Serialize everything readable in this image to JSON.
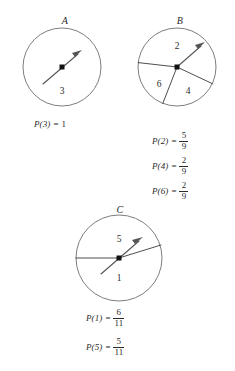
{
  "figure": {
    "type": "probability-spinners",
    "background": "#ffffff",
    "stroke_color": "#6e6e6e",
    "text_color": "#2b2b2b"
  },
  "spinners": [
    {
      "id": "A",
      "label": "A",
      "sectors": [
        {
          "value": "3",
          "label": "3"
        }
      ],
      "captions": [
        {
          "lhs": "P(3)",
          "eq": "=",
          "whole": "1"
        }
      ]
    },
    {
      "id": "B",
      "label": "B",
      "sectors": [
        {
          "value": "2",
          "label": "2"
        },
        {
          "value": "6",
          "label": "6"
        },
        {
          "value": "4",
          "label": "4"
        }
      ],
      "captions": [
        {
          "lhs": "P(2)",
          "eq": "=",
          "num": "5",
          "den": "9"
        },
        {
          "lhs": "P(4)",
          "eq": "=",
          "num": "2",
          "den": "9"
        },
        {
          "lhs": "P(6)",
          "eq": "=",
          "num": "2",
          "den": "9"
        }
      ]
    },
    {
      "id": "C",
      "label": "C",
      "sectors": [
        {
          "value": "5",
          "label": "5"
        },
        {
          "value": "1",
          "label": "1"
        }
      ],
      "captions": [
        {
          "lhs": "P(1)",
          "eq": "=",
          "num": "6",
          "den": "11"
        },
        {
          "lhs": "P(5)",
          "eq": "=",
          "num": "5",
          "den": "11"
        }
      ]
    }
  ]
}
